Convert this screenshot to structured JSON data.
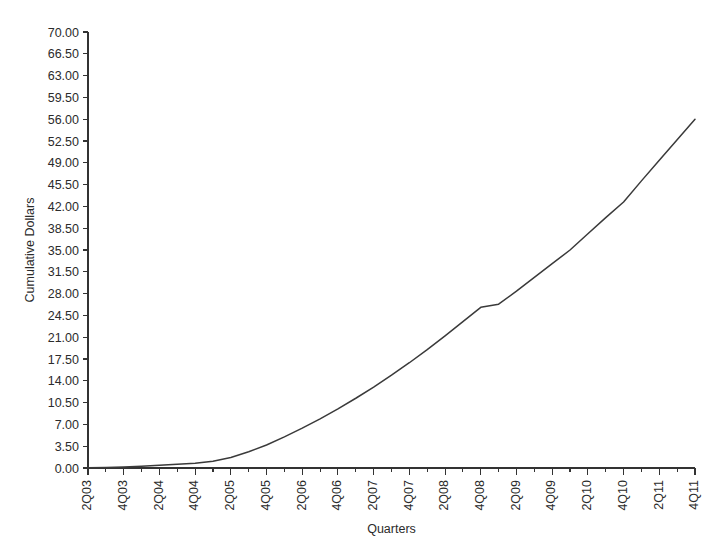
{
  "chart_data": {
    "type": "line",
    "title": "",
    "xlabel": "Quarters",
    "ylabel": "Cumulative Dollars",
    "ylim": [
      0,
      70
    ],
    "ytick_step": 3.5,
    "ytick_labels": [
      "0.00",
      "3.50",
      "7.00",
      "10.50",
      "14.00",
      "17.50",
      "21.00",
      "24.50",
      "28.00",
      "31.50",
      "35.00",
      "38.50",
      "42.00",
      "45.50",
      "49.00",
      "52.50",
      "56.00",
      "59.50",
      "63.00",
      "66.50",
      "70.00"
    ],
    "grid": false,
    "legend": "none",
    "categories": [
      "2Q03",
      "3Q03",
      "4Q03",
      "1Q04",
      "2Q04",
      "3Q04",
      "4Q04",
      "1Q05",
      "2Q05",
      "3Q05",
      "4Q05",
      "1Q06",
      "2Q06",
      "3Q06",
      "4Q06",
      "1Q07",
      "2Q07",
      "3Q07",
      "4Q07",
      "1Q08",
      "2Q08",
      "3Q08",
      "4Q08",
      "1Q09",
      "2Q09",
      "3Q09",
      "4Q09",
      "1Q10",
      "2Q10",
      "3Q10",
      "4Q10",
      "1Q11",
      "2Q11",
      "3Q11",
      "4Q11"
    ],
    "xtick_labels_visible": [
      "2Q03",
      "4Q03",
      "2Q04",
      "4Q04",
      "2Q05",
      "4Q05",
      "2Q06",
      "4Q06",
      "2Q07",
      "4Q07",
      "2Q08",
      "4Q08",
      "2Q09",
      "4Q09",
      "2Q10",
      "4Q10",
      "2Q11",
      "4Q11"
    ],
    "series": [
      {
        "name": "Cumulative Dollars",
        "color": "#3a3a3a",
        "values": [
          0.05,
          0.1,
          0.18,
          0.3,
          0.45,
          0.6,
          0.75,
          1.1,
          1.7,
          2.6,
          3.7,
          5.0,
          6.4,
          7.9,
          9.5,
          11.2,
          13.0,
          14.9,
          16.9,
          19.0,
          21.2,
          23.5,
          25.8,
          26.3,
          28.4,
          30.6,
          32.8,
          35.0,
          37.6,
          40.2,
          42.7,
          46.1,
          49.4,
          52.7,
          56.0
        ]
      }
    ]
  },
  "axes": {
    "y_title": "Cumulative Dollars",
    "x_title": "Quarters"
  }
}
